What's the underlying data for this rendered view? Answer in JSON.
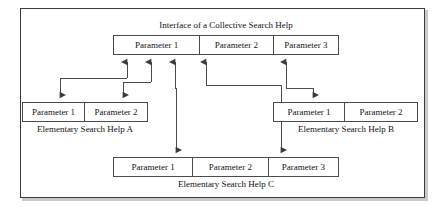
{
  "diagram": {
    "title": "Interface of a Collective Search Help",
    "collective": {
      "name": "collective-search-help",
      "parameters": [
        "Parameter 1",
        "Parameter 2",
        "Parameter 3"
      ]
    },
    "elementary": [
      {
        "id": "a",
        "caption": "Elementary Search Help A",
        "parameters": [
          "Parameter 1",
          "Parameter 2"
        ]
      },
      {
        "id": "b",
        "caption": "Elementary Search Help B",
        "parameters": [
          "Parameter 1",
          "Parameter 2"
        ]
      },
      {
        "id": "c",
        "caption": "Elementary Search Help C",
        "parameters": [
          "Parameter 1",
          "Parameter 2",
          "Parameter 3"
        ]
      }
    ],
    "connections": [
      {
        "from": "collective.Parameter 1",
        "to": "a.Parameter 1"
      },
      {
        "from": "collective.Parameter 1",
        "to": "a.Parameter 2"
      },
      {
        "from": "collective.Parameter 1",
        "to": "c.Parameter 1"
      },
      {
        "from": "collective.Parameter 2",
        "to": "c.Parameter 3"
      },
      {
        "from": "collective.Parameter 3",
        "to": "b.Parameter 1"
      }
    ],
    "colors": {
      "line": "#4a4a4a",
      "border": "#3a3a3a",
      "text": "#111111",
      "shadow": "#c9c9c9",
      "background": "#ffffff"
    }
  }
}
